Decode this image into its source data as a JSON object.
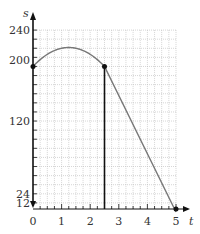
{
  "chart_data": {
    "type": "line",
    "title": "",
    "xlabel": "t",
    "ylabel": "s",
    "xlim": [
      0,
      5
    ],
    "ylim": [
      0,
      240
    ],
    "grid": true,
    "x_ticks": [
      "0",
      "1",
      "2",
      "3",
      "4",
      "5"
    ],
    "y_ticks": [
      "12",
      "24",
      "120",
      "200",
      "240"
    ],
    "series": [
      {
        "name": "s(t) parabola",
        "description": "s = -16t^2 + 40t + 192 for 0 <= t <= 2.5",
        "x": [
          0,
          0.25,
          0.5,
          0.75,
          1.0,
          1.25,
          1.5,
          1.75,
          2.0,
          2.25,
          2.5
        ],
        "values": [
          192,
          201,
          208,
          213,
          216,
          217,
          216,
          213,
          208,
          201,
          192
        ]
      },
      {
        "name": "s(t) linear",
        "x": [
          2.5,
          5
        ],
        "values": [
          192,
          0
        ]
      }
    ],
    "annotations": [
      {
        "type": "point",
        "x": 0,
        "y": 192
      },
      {
        "type": "point",
        "x": 2.5,
        "y": 192
      },
      {
        "type": "point",
        "x": 5,
        "y": 0
      },
      {
        "type": "vertical-segment",
        "x": 2.5,
        "y0": 0,
        "y1": 192
      }
    ]
  }
}
